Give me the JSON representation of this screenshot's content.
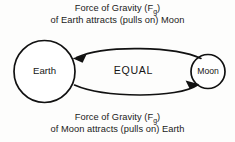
{
  "diagram": {
    "title_top": {
      "line1_prefix": "Force of Gravity (F",
      "line1_sub": "g",
      "line1_suffix": ")",
      "line2": "of Earth attracts (pulls on) Moon"
    },
    "title_bottom": {
      "line1_prefix": "Force of Gravity (F",
      "line1_sub": "g",
      "line1_suffix": ")",
      "line2": "of Moon attracts (pulls on) Earth"
    },
    "bodies": [
      {
        "name": "Earth",
        "label": "Earth"
      },
      {
        "name": "Moon",
        "label": "Moon"
      }
    ],
    "center_label": "EQUAL",
    "colors": {
      "stroke": "#111111",
      "background": "#fdfdfc",
      "text": "#1a1a1a"
    }
  }
}
